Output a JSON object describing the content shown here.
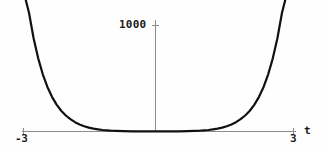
{
  "figure": {
    "background_color": "#fefefe",
    "curve_color": "#111111",
    "axis_color": "#8c8c8c",
    "text_color": "#1a1a1a"
  },
  "labels": {
    "y_tick_1000": "1000",
    "x_tick_min": "-3",
    "x_tick_max": "3",
    "x_axis_name": "t"
  },
  "chart_data": {
    "type": "line",
    "title": "",
    "xlabel": "t",
    "ylabel": "",
    "xlim": [
      -3,
      3
    ],
    "ylim": [
      0,
      1250
    ],
    "grid": false,
    "legend": null,
    "x_ticks": [
      -3,
      3
    ],
    "x_tick_labels": [
      "-3",
      "3"
    ],
    "y_ticks": [
      1000
    ],
    "y_tick_labels": [
      "1000"
    ],
    "axes_style": "centered-origin",
    "series": [
      {
        "name": "curve",
        "color": "#111111",
        "linewidth": 2.2,
        "x": [
          -2.82,
          -2.75,
          -2.65,
          -2.55,
          -2.45,
          -2.35,
          -2.25,
          -2.15,
          -2.05,
          -1.95,
          -1.85,
          -1.75,
          -1.65,
          -1.55,
          -1.45,
          -1.35,
          -1.25,
          -1.15,
          -1.05,
          -0.95,
          -0.85,
          -0.7,
          -0.5,
          -0.3,
          0,
          0.3,
          0.5,
          0.7,
          0.85,
          0.95,
          1.05,
          1.15,
          1.25,
          1.35,
          1.45,
          1.55,
          1.65,
          1.75,
          1.85,
          1.95,
          2.05,
          2.15,
          2.25,
          2.35,
          2.45,
          2.55,
          2.65,
          2.75,
          2.82
        ],
        "y": [
          1240,
          1120,
          880,
          690,
          540,
          420,
          327,
          254,
          196,
          151,
          116,
          88,
          67,
          50,
          37,
          27,
          20,
          14,
          10,
          7,
          5,
          3,
          1.5,
          0.7,
          0.4,
          0.7,
          1.5,
          3,
          5,
          7,
          10,
          14,
          20,
          27,
          37,
          50,
          67,
          88,
          116,
          151,
          196,
          254,
          327,
          420,
          540,
          690,
          880,
          1120,
          1240
        ]
      }
    ]
  }
}
